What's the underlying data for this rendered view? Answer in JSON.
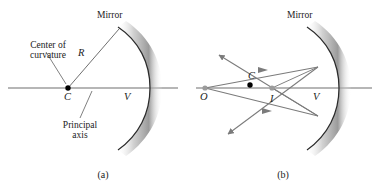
{
  "figure": {
    "title_visible": false,
    "panels": [
      {
        "id": "a",
        "caption": "(a)",
        "labels": {
          "mirror": "Mirror",
          "center_of_curvature_line1": "Center of",
          "center_of_curvature_line2": "curvature",
          "radius": "R",
          "center_point": "C",
          "vertex_point": "V",
          "principal_axis_line1": "Principal",
          "principal_axis_line2": "axis"
        },
        "points": [
          {
            "name": "C",
            "label": "C",
            "x": 68,
            "y": 88,
            "style": "filled-black"
          },
          {
            "name": "V",
            "label": "V",
            "x": 133,
            "y": 88,
            "style": "none"
          }
        ]
      },
      {
        "id": "b",
        "caption": "(b)",
        "labels": {
          "mirror": "Mirror",
          "object_point": "O",
          "center_point": "C",
          "image_point": "I",
          "vertex_point": "V"
        },
        "points": [
          {
            "name": "O",
            "label": "O",
            "x": 205,
            "y": 88,
            "style": "filled-gray"
          },
          {
            "name": "C",
            "label": "C",
            "x": 250,
            "y": 85,
            "style": "filled-black"
          },
          {
            "name": "I",
            "label": "I",
            "x": 272,
            "y": 88,
            "style": "filled-gray"
          },
          {
            "name": "V",
            "label": "V",
            "x": 322,
            "y": 88,
            "style": "none"
          }
        ],
        "ray_count": 4
      }
    ],
    "colors": {
      "axis": "#6f6f6f",
      "ray": "#7b7b7b",
      "mirror_stroke": "#2b2b2b",
      "mirror_band_light": "#ffffff",
      "mirror_band_dark": "#9a9a9a",
      "point_black": "#000000",
      "point_gray": "#9b9b9b",
      "leader": "#555555",
      "text": "#222222",
      "background": "#ffffff"
    }
  }
}
